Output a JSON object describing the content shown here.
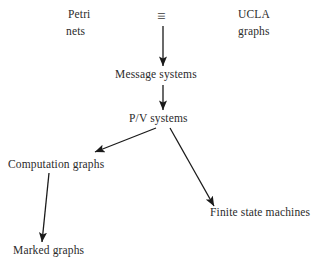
{
  "figure": {
    "type": "hierarchy-diagram",
    "background_color": "#ffffff",
    "ink_color": "#2b2b2b",
    "arrow_color": "#1a1a1a"
  },
  "nodes": {
    "petri_nets": {
      "label_line1": "Petri",
      "label_line2": "nets",
      "full_label": "Petri nets"
    },
    "equivalence_symbol": {
      "glyph": "≡",
      "icon_name": "identical-to-icon",
      "meaning": "equivalent"
    },
    "ucla_graphs": {
      "label_line1": "UCLA",
      "label_line2": "graphs",
      "full_label": "UCLA graphs"
    },
    "message_systems": {
      "label": "Message systems"
    },
    "pv_systems": {
      "label": "P/V systems"
    },
    "computation_graphs": {
      "label": "Computation graphs"
    },
    "marked_graphs": {
      "label": "Marked graphs"
    },
    "finite_state_machines": {
      "label": "Finite state machines"
    }
  },
  "edges": [
    {
      "id": "edge-top-to-message-systems",
      "from": "equivalence_symbol",
      "to": "message_systems",
      "direction": "down",
      "x1": 163,
      "y1": 26,
      "x2": 163,
      "y2": 66
    },
    {
      "id": "edge-message-systems-to-pv-systems",
      "from": "message_systems",
      "to": "pv_systems",
      "direction": "down",
      "x1": 163,
      "y1": 85,
      "x2": 163,
      "y2": 110
    },
    {
      "id": "edge-pv-systems-to-computation-graphs",
      "from": "pv_systems",
      "to": "computation_graphs",
      "direction": "down-left",
      "x1": 156,
      "y1": 128,
      "x2": 95,
      "y2": 152
    },
    {
      "id": "edge-pv-systems-to-finite-state-machines",
      "from": "pv_systems",
      "to": "finite_state_machines",
      "direction": "down-right",
      "x1": 170,
      "y1": 128,
      "x2": 214,
      "y2": 206
    },
    {
      "id": "edge-computation-graphs-to-marked-graphs",
      "from": "computation_graphs",
      "to": "marked_graphs",
      "direction": "down-left",
      "x1": 49,
      "y1": 173,
      "x2": 42,
      "y2": 242
    }
  ]
}
